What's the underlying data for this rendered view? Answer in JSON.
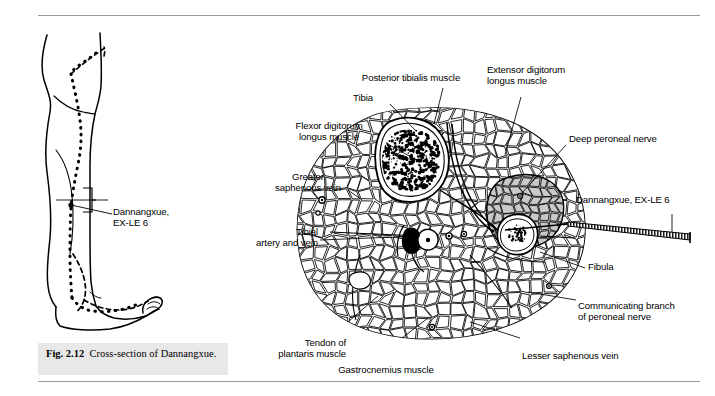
{
  "figure": {
    "caption_label": "Fig. 2.12",
    "caption_text": "Cross-section of Dannangxue.",
    "caption_bg": "#e8e8e8"
  },
  "colors": {
    "ink": "#000000",
    "rule": "#9a9a9a",
    "shaded_muscle": "#c9c9c9",
    "bone_fill": "#ffffff",
    "paper": "#ffffff"
  },
  "leg_panel": {
    "point_label_line1": "Dannangxue,",
    "point_label_line2": "EX-LE 6",
    "meridian_style": "dotted"
  },
  "cross_section": {
    "needle_label": "Dannangxue, EX-LE 6",
    "labels": [
      {
        "id": "posterior-tibialis-muscle",
        "text": "Posterior tibialis muscle",
        "align": "center"
      },
      {
        "id": "tibia",
        "text": "Tibia",
        "align": "center"
      },
      {
        "id": "extensor-digitorum-longus-muscle",
        "text": "Extensor digitorum\nlongus muscle",
        "align": "left"
      },
      {
        "id": "flexor-digitorum-longus-muscle",
        "text": "Flexor digitorum\nlongus muscle",
        "align": "center"
      },
      {
        "id": "deep-peroneal-nerve",
        "text": "Deep peroneal nerve",
        "align": "left"
      },
      {
        "id": "greater-saphenous-vein",
        "text": "Greater\nsaphenous vein",
        "align": "center"
      },
      {
        "id": "tibial-artery-and-vein",
        "text": "Tibial\nartery and vein",
        "align": "right"
      },
      {
        "id": "fibula",
        "text": "Fibula",
        "align": "left"
      },
      {
        "id": "communicating-branch-of-peroneal-nerve",
        "text": "Communicating branch\nof peroneal nerve",
        "align": "left"
      },
      {
        "id": "lesser-saphenous-vein",
        "text": "Lesser saphenous vein",
        "align": "left"
      },
      {
        "id": "tendon-of-plantaris-muscle",
        "text": "Tendon of\nplantaris muscle",
        "align": "right"
      },
      {
        "id": "gastrocnemius-muscle",
        "text": "Gastrocnemius muscle",
        "align": "center"
      }
    ]
  }
}
